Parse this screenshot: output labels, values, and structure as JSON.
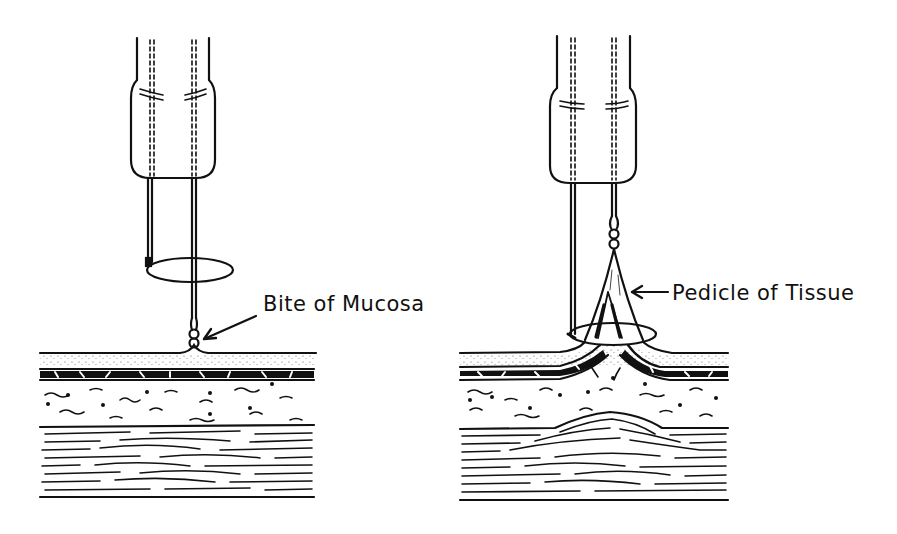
{
  "figure": {
    "panels": [
      {
        "id": "left",
        "label": "Bite of Mucosa",
        "description": "Snare instrument tip with loop open, grasping a small bite of mucosa at the surface; tissue layers flat"
      },
      {
        "id": "right",
        "label": "Pedicle of Tissue",
        "description": "Mucosa drawn up into a cone-shaped pedicle with snare loop around its base; underlying layers tented upward"
      }
    ],
    "colors": {
      "ink": "#111111",
      "background": "#ffffff"
    }
  }
}
